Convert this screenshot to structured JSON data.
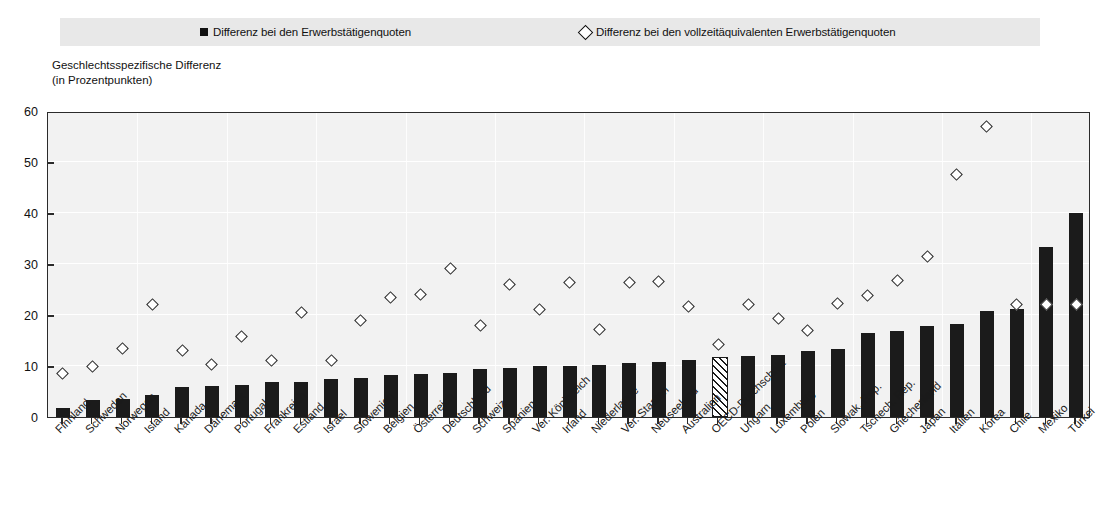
{
  "legend": {
    "items": [
      {
        "marker": "filled-square-marker",
        "label": "Differenz bei den Erwerbstätigenquoten"
      },
      {
        "marker": "open-diamond-marker",
        "label": "Differenz bei den vollzeitäquivalenten Erwerbstätigenquoten"
      }
    ]
  },
  "axis_caption": {
    "line1": "Geschlechtsspezifische Differenz",
    "line2": "(in Prozentpunkten)"
  },
  "colors": {
    "bar": "#1b1b1b",
    "marker_outline": "#262626",
    "plot_background": "#f2f2f2",
    "legend_background": "#e8e8e8",
    "axis": "#2b2b2b"
  },
  "chart_data": {
    "type": "bar",
    "title": "",
    "xlabel": "",
    "ylabel": "Geschlechtsspezifische Differenz (in Prozentpunkten)",
    "ylim": [
      0,
      60
    ],
    "yticks": [
      0,
      10,
      20,
      30,
      40,
      50,
      60
    ],
    "grid": true,
    "legend_position": "top",
    "categories": [
      "Finnland",
      "Schweden",
      "Norwegen",
      "Island",
      "Kanada",
      "Dänemark",
      "Portugal",
      "Frankreich",
      "Estland",
      "Israel",
      "Slowenien",
      "Belgien",
      "Österreich",
      "Deutschland",
      "Schweiz",
      "Spanien",
      "Ver. Königreich",
      "Irland",
      "Niederlande",
      "Ver. Staaten",
      "Neuseeland",
      "Australien",
      "OECD-Durchschnitt",
      "Ungarn",
      "Luxemburg",
      "Polen",
      "Slowak. Rep.",
      "Tschech. Rep.",
      "Griechenland",
      "Japan",
      "Italien",
      "Korea",
      "Chile",
      "Mexiko",
      "Türkei"
    ],
    "series": [
      {
        "name": "Differenz bei den Erwerbstätigenquoten",
        "type": "bar",
        "values": [
          1.7,
          3.3,
          3.6,
          4.4,
          5.8,
          6.0,
          6.3,
          6.8,
          6.8,
          7.4,
          7.6,
          8.2,
          8.5,
          8.7,
          9.4,
          9.7,
          10.0,
          10.1,
          10.2,
          10.6,
          10.8,
          11.1,
          11.4,
          11.9,
          12.1,
          13.0,
          13.4,
          16.4,
          16.9,
          17.9,
          18.2,
          20.8,
          21.1,
          33.4,
          40.1
        ]
      },
      {
        "name": "Differenz bei den vollzeitäquivalenten Erwerbstätigenquoten",
        "type": "scatter",
        "values": [
          8.5,
          10.0,
          13.4,
          22.0,
          13.1,
          10.2,
          15.8,
          11.1,
          20.4,
          11.1,
          19.0,
          23.5,
          24.1,
          29.2,
          17.9,
          26.0,
          21.0,
          26.3,
          17.2,
          26.3,
          26.5,
          21.6,
          14.3,
          22.0,
          19.4,
          16.9,
          22.3,
          23.8,
          26.8,
          31.4,
          47.5,
          57.0,
          22.0,
          22.0,
          22.0
        ]
      }
    ],
    "note_hatched_category": "OECD-Durchschnitt"
  }
}
